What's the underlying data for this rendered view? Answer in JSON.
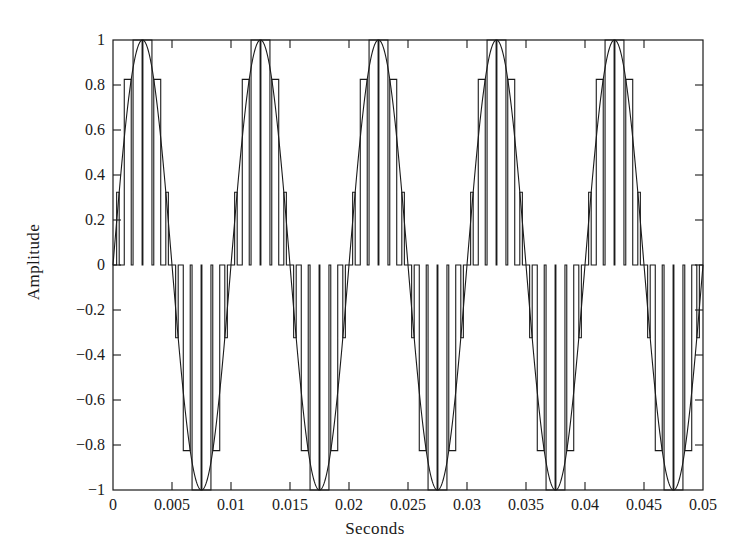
{
  "chart_data": {
    "type": "line",
    "title": "",
    "subtitle": "",
    "xlabel": "Seconds",
    "ylabel": "Amplitude",
    "xlim": [
      0,
      0.05
    ],
    "ylim": [
      -1,
      1
    ],
    "grid": false,
    "legend": null,
    "xticks": [
      0,
      0.005,
      0.01,
      0.015,
      0.02,
      0.025,
      0.03,
      0.035,
      0.04,
      0.045,
      0.05
    ],
    "xticklabels": [
      "0",
      "0.005",
      "0.01",
      "0.015",
      "0.02",
      "0.025",
      "0.03",
      "0.035",
      "0.04",
      "0.045",
      "0.05"
    ],
    "yticks": [
      -1,
      -0.8,
      -0.6,
      -0.4,
      -0.2,
      0,
      0.2,
      0.4,
      0.6,
      0.8,
      1
    ],
    "yticklabels": [
      "−1",
      "−0.8",
      "−0.6",
      "−0.4",
      "−0.2",
      "0",
      "0.2",
      "0.4",
      "0.6",
      "0.8",
      "1"
    ],
    "line_color": "#1a1a1a",
    "background_color": "#ffffff",
    "series": [
      {
        "name": "sine-reference",
        "kind": "sine",
        "amplitude": 1,
        "frequency_hz": 100,
        "phase_rad": 0,
        "cycles_shown": 5,
        "peaks_at_seconds": [
          0.0025,
          0.0125,
          0.0225,
          0.0325,
          0.0425
        ],
        "troughs_at_seconds": [
          0.0075,
          0.0175,
          0.0275,
          0.0375,
          0.0475
        ],
        "zero_crossings_seconds": [
          0,
          0.005,
          0.01,
          0.015,
          0.02,
          0.025,
          0.03,
          0.035,
          0.04,
          0.045,
          0.05
        ]
      },
      {
        "name": "pwm-pulse-train",
        "kind": "spwm",
        "carrier_frequency_hz": 1200,
        "pulses_per_sine_cycle": 12,
        "pulses_per_half_cycle": 6,
        "total_pulses": 60,
        "pulse_amplitude_follows_sine": true,
        "duty_cycle_modulation": "sinusoidal",
        "peak_value": 1,
        "min_value": -1
      }
    ],
    "annotations": []
  },
  "axes": {
    "frame": "box",
    "tick_direction": "in",
    "ticks_on": [
      "left",
      "bottom",
      "right",
      "top"
    ]
  }
}
